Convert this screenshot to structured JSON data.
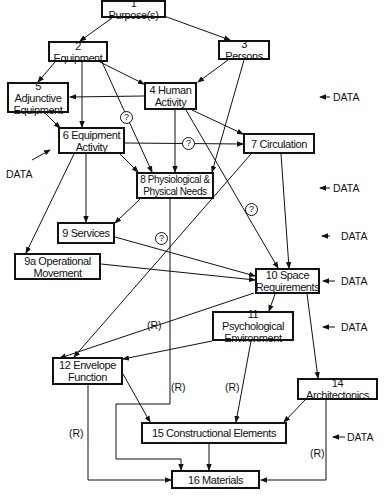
{
  "nodes": {
    "n1": "1 Purpose(s)",
    "n2": "2 Equipment",
    "n3": "3 Persons",
    "n4": "4 Human\nActivity",
    "n5": "5 Adjunctive\nEquipment",
    "n6": "6 Equipment\nActivity",
    "n7": "7 Circulation",
    "n8": "8 Physiological &\nPhysical Needs",
    "n9": "9 Services",
    "n9a": "9a Operational\nMovement",
    "n10": "10 Space\nRequirements",
    "n11": "11 Psychological\nEnvironment",
    "n12": "12 Envelope\nFunction",
    "n14": "14 Architectonics",
    "n15": "15  Constructional Elements",
    "n16": "16 Materials"
  },
  "labels": {
    "data": "DATA",
    "data_arrow": "← DATA",
    "r": "(R)",
    "question": "?"
  },
  "colors": {
    "line": "#111111",
    "background": "#ffffff"
  }
}
